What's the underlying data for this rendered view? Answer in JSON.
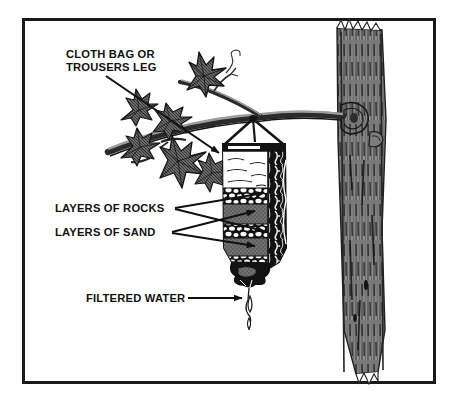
{
  "figure": {
    "background_color": "#ffffff",
    "frame_color": "#1a1a1a",
    "ink_color": "#111111",
    "bark_gray": "#8c8c8c",
    "leaf_gray": "#6e6e6e",
    "sand_gray": "#707070"
  },
  "labels": {
    "cloth_bag": "CLOTH BAG OR\nTROUSERS LEG",
    "layers_of_rocks": "LAYERS OF ROCKS",
    "layers_of_sand": "LAYERS OF SAND",
    "filtered_water": "FILTERED WATER"
  },
  "scene": {
    "tree_trunk": "tree-trunk",
    "branch": "tree-branch",
    "foliage": "leaf-cluster",
    "filter_bag": "filter-bag",
    "water_drop": "water-drop",
    "suspension_cords": "hanging-cords"
  },
  "bag_contents": [
    {
      "layer": "water",
      "label": "water"
    },
    {
      "layer": "rocks",
      "label": "rocks"
    },
    {
      "layer": "sand",
      "label": "sand"
    },
    {
      "layer": "rocks",
      "label": "rocks"
    },
    {
      "layer": "sand",
      "label": "sand"
    },
    {
      "layer": "rocks",
      "label": "rocks"
    }
  ]
}
